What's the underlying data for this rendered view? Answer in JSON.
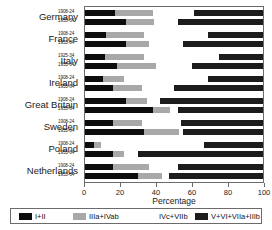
{
  "chart_data": {
    "type": "bar",
    "subtype": "stacked-horizontal-bar",
    "title": "",
    "xlabel": "Percentage",
    "ylabel": "",
    "xlim": [
      0,
      100
    ],
    "xticks": [
      0,
      20,
      40,
      60,
      80,
      100
    ],
    "xtick_labels": [
      "0",
      "20",
      "40",
      "60",
      "80",
      "100"
    ],
    "grid": false,
    "legend_position": "bottom",
    "stack_order": [
      "I+II",
      "IIIa+IVab",
      "IVc+VIIb",
      "V+VI+VIIa+IIIb"
    ],
    "series": [
      {
        "name": "I+II",
        "color": "#0d0d0d"
      },
      {
        "name": "IIIa+IVab",
        "color": "#a8a8a8"
      },
      {
        "name": "IVc+VIIb",
        "color": "#ffffff"
      },
      {
        "name": "V+VI+VIIa+IIIb",
        "color": "#1c1c1c"
      }
    ],
    "categories": [
      "Germany",
      "France",
      "Italy",
      "Ireland",
      "Great Britain",
      "Sweden",
      "Poland",
      "Netherlands"
    ],
    "groups": [
      {
        "category": "Germany",
        "cohorts": [
          {
            "period": "1908-24",
            "values": [
              17,
              21,
              23,
              39
            ]
          },
          {
            "period": "1955-64",
            "values": [
              23,
              16,
              13,
              48
            ]
          }
        ]
      },
      {
        "category": "France",
        "cohorts": [
          {
            "period": "1908-24",
            "values": [
              12,
              21,
              36,
              31
            ]
          },
          {
            "period": "1955-64",
            "values": [
              23,
              13,
              19,
              45
            ]
          }
        ]
      },
      {
        "category": "Italy",
        "cohorts": [
          {
            "period": "1925-34",
            "values": [
              11,
              22,
              42,
              25
            ]
          },
          {
            "period": "1955-64",
            "values": [
              18,
              22,
              20,
              40
            ]
          }
        ]
      },
      {
        "category": "Ireland",
        "cohorts": [
          {
            "period": "1908-24",
            "values": [
              10,
              12,
              47,
              31
            ]
          },
          {
            "period": "1955-64",
            "values": [
              16,
              16,
              18,
              50
            ]
          }
        ]
      },
      {
        "category": "Great Britain",
        "cohorts": [
          {
            "period": "1908-24",
            "values": [
              23,
              12,
              7,
              58
            ]
          },
          {
            "period": "1955-64",
            "values": [
              38,
              10,
              4,
              48
            ]
          }
        ]
      },
      {
        "category": "Sweden",
        "cohorts": [
          {
            "period": "1908-24",
            "values": [
              16,
              16,
              22,
              46
            ]
          },
          {
            "period": "1955-64",
            "values": [
              33,
              20,
              2,
              45
            ]
          }
        ]
      },
      {
        "category": "Poland",
        "cohorts": [
          {
            "period": "1908-24",
            "values": [
              5,
              4,
              58,
              33
            ]
          },
          {
            "period": "1955-64",
            "values": [
              16,
              6,
              8,
              70
            ]
          }
        ]
      },
      {
        "category": "Netherlands",
        "cohorts": [
          {
            "period": "1908-24",
            "values": [
              16,
              20,
              16,
              48
            ]
          },
          {
            "period": "1955-64",
            "values": [
              30,
              13,
              4,
              53
            ]
          }
        ]
      }
    ]
  },
  "legend": {
    "items": [
      {
        "label": "I+II",
        "color": "#0d0d0d"
      },
      {
        "label": "IIIa+IVab",
        "color": "#a8a8a8"
      },
      {
        "label": "IVc+VIIb",
        "color": "#ffffff"
      },
      {
        "label": "V+VI+VIIa+IIIb",
        "color": "#1c1c1c"
      }
    ]
  }
}
